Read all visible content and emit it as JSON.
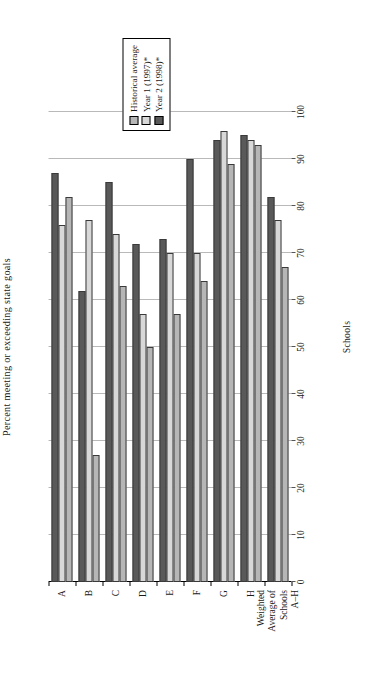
{
  "chart_data": {
    "type": "bar",
    "title": "",
    "xlabel": "Schools",
    "ylabel": "Percent meeting or exceeding state goals",
    "ylim": [
      0,
      100
    ],
    "ytick_step": 10,
    "grid": true,
    "orientation": "vertical-bars-rendered-rotated",
    "legend_position": "top-right",
    "categories": [
      "A",
      "B",
      "C",
      "D",
      "E",
      "F",
      "G",
      "H",
      "Weighted Average of Schools A–H"
    ],
    "category_lines": [
      [
        "A"
      ],
      [
        "B"
      ],
      [
        "C"
      ],
      [
        "D"
      ],
      [
        "E"
      ],
      [
        "F"
      ],
      [
        "G"
      ],
      [
        "H"
      ],
      [
        "Weighted",
        "Average of",
        "Schools",
        "A–H"
      ]
    ],
    "ticks": [
      "0",
      "10",
      "20",
      "30",
      "40",
      "50",
      "60",
      "70",
      "80",
      "90",
      "100"
    ],
    "series": [
      {
        "name": "Historical average",
        "color": "#b6b6b6",
        "values": [
          82,
          27,
          63,
          50,
          57,
          64,
          89,
          93,
          67
        ]
      },
      {
        "name": "Year 1 (1997)*",
        "color": "#d8d8d8",
        "values": [
          76,
          77,
          74,
          57,
          70,
          70,
          96,
          94,
          77
        ]
      },
      {
        "name": "Year 2 (1998)*",
        "color": "#595959",
        "values": [
          87,
          62,
          85,
          72,
          73,
          90,
          94,
          95,
          82
        ]
      }
    ],
    "legend": [
      {
        "label": "Historical average",
        "color": "#b6b6b6"
      },
      {
        "label": "Year 1 (1997)*",
        "color": "#d8d8d8"
      },
      {
        "label": "Year 2 (1998)*",
        "color": "#595959"
      }
    ]
  }
}
